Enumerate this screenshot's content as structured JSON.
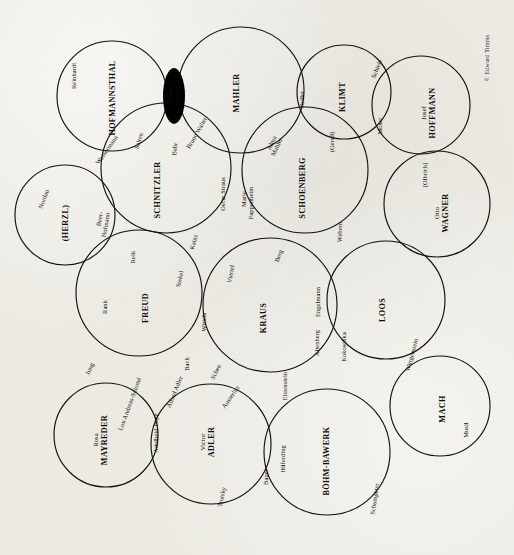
{
  "figure": {
    "credit": "© Edward Timms",
    "orientation": "rotated-90-ccw",
    "line_color": "#14120f",
    "background_color": "#eceae3"
  },
  "chart_data": {
    "type": "diagram",
    "subtype": "venn-circles-network",
    "annotations": [
      "© Edward Timms"
    ],
    "circles": [
      {
        "label": "HOFMANNSTHAL",
        "prefix": "",
        "cx": 112,
        "cy": 96,
        "r": 55
      },
      {
        "label": "MAHLER",
        "prefix": "",
        "cx": 241,
        "cy": 90,
        "r": 63
      },
      {
        "label": "KLIMT",
        "prefix": "",
        "cx": 344,
        "cy": 92,
        "r": 47
      },
      {
        "label": "HOFFMANN",
        "prefix": "Josef",
        "cx": 421,
        "cy": 105,
        "r": 49
      },
      {
        "label": "SCHNITZLER",
        "prefix": "",
        "cx": 166,
        "cy": 168,
        "r": 65
      },
      {
        "label": "SCHOENBERG",
        "prefix": "",
        "cx": 305,
        "cy": 170,
        "r": 63
      },
      {
        "label": "WAGNER",
        "prefix": "Otto",
        "cx": 437,
        "cy": 204,
        "r": 53
      },
      {
        "label": "(HERZL)",
        "prefix": "",
        "cx": 65,
        "cy": 215,
        "r": 50
      },
      {
        "label": "FREUD",
        "prefix": "",
        "cx": 139,
        "cy": 293,
        "r": 63
      },
      {
        "label": "KRAUS",
        "prefix": "",
        "cx": 270,
        "cy": 305,
        "r": 67
      },
      {
        "label": "LOOS",
        "prefix": "",
        "cx": 386,
        "cy": 300,
        "r": 59
      },
      {
        "label": "MAYREDER",
        "prefix": "Rosa",
        "cx": 106,
        "cy": 435,
        "r": 52
      },
      {
        "label": "ADLER",
        "prefix": "Victor",
        "cx": 211,
        "cy": 444,
        "r": 60
      },
      {
        "label": "BÖHM-BAWERK",
        "prefix": "",
        "cx": 327,
        "cy": 452,
        "r": 63
      },
      {
        "label": "MACH",
        "prefix": "",
        "cx": 440,
        "cy": 406,
        "r": 50
      },
      {
        "label": "lens-richard-strauss",
        "prefix": "",
        "cx": 0,
        "cy": 0,
        "r": 0
      }
    ],
    "intersection_labels": [
      {
        "text": "Reinhardt",
        "x": 73,
        "y": 75
      },
      {
        "text": "Wassermann",
        "x": 106,
        "y": 148
      },
      {
        "text": "Salten",
        "x": 137,
        "y": 140
      },
      {
        "text": "Richard\nStrauss",
        "x": 174,
        "y": 94
      },
      {
        "text": "Bahr",
        "x": 174,
        "y": 147
      },
      {
        "text": "Bruno Walter",
        "x": 196,
        "y": 140
      },
      {
        "text": "Oscar Straus",
        "x": 224,
        "y": 193
      },
      {
        "text": "Marie\nPappenheim",
        "x": 247,
        "y": 200
      },
      {
        "text": "Alma\nMahler",
        "x": 275,
        "y": 141
      },
      {
        "text": "Roller",
        "x": 302,
        "y": 98
      },
      {
        "text": "(Gerstl)",
        "x": 332,
        "y": 140
      },
      {
        "text": "Schiele",
        "x": 376,
        "y": 70
      },
      {
        "text": "Moser",
        "x": 379,
        "y": 124
      },
      {
        "text": "[Olbrich]",
        "x": 425,
        "y": 173
      },
      {
        "text": "Nordau",
        "x": 44,
        "y": 197
      },
      {
        "text": "Beer-\nHofmann",
        "x": 104,
        "y": 222
      },
      {
        "text": "Reik",
        "x": 132,
        "y": 255
      },
      {
        "text": "Kainz",
        "x": 194,
        "y": 240
      },
      {
        "text": "Stekel",
        "x": 180,
        "y": 278
      },
      {
        "text": "Viertel",
        "x": 231,
        "y": 272
      },
      {
        "text": "Berg",
        "x": 279,
        "y": 255
      },
      {
        "text": "Webern",
        "x": 339,
        "y": 230
      },
      {
        "text": "Rank",
        "x": 105,
        "y": 305
      },
      {
        "text": "Wittels",
        "x": 203,
        "y": 320
      },
      {
        "text": "Engelmann",
        "x": 318,
        "y": 300
      },
      {
        "text": "Altenberg",
        "x": 317,
        "y": 340
      },
      {
        "text": "Kokoschka",
        "x": 343,
        "y": 344
      },
      {
        "text": "Wittgenstein",
        "x": 411,
        "y": 352
      },
      {
        "text": "Jung",
        "x": 90,
        "y": 367
      },
      {
        "text": "Bach",
        "x": 186,
        "y": 362
      },
      {
        "text": "Scheu",
        "x": 214,
        "y": 370
      },
      {
        "text": "Alfred Adler",
        "x": 172,
        "y": 391
      },
      {
        "text": "Lou Andreas-Salomé",
        "x": 128,
        "y": 400
      },
      {
        "text": "Adelheid Popp",
        "x": 155,
        "y": 431
      },
      {
        "text": "Austerlitz",
        "x": 228,
        "y": 394
      },
      {
        "text": "Ehrenstein",
        "x": 284,
        "y": 383
      },
      {
        "text": "Musil",
        "x": 465,
        "y": 428
      },
      {
        "text": "Trotsky",
        "x": 221,
        "y": 495
      },
      {
        "text": "Bauer",
        "x": 266,
        "y": 475
      },
      {
        "text": "Hilferding",
        "x": 282,
        "y": 457
      },
      {
        "text": "Schumpeter",
        "x": 374,
        "y": 497
      }
    ]
  },
  "labels": {
    "majors": [
      {
        "prefix": "",
        "name": "HOFMANNSTHAL",
        "x": 113,
        "y": 98
      },
      {
        "prefix": "",
        "name": "MAHLER",
        "x": 237,
        "y": 93
      },
      {
        "prefix": "",
        "name": "KLIMT",
        "x": 343,
        "y": 97
      },
      {
        "prefix": "Josef",
        "name": "HOFFMANN",
        "x": 429,
        "y": 113
      },
      {
        "prefix": "",
        "name": "SCHNITZLER",
        "x": 158,
        "y": 190
      },
      {
        "prefix": "",
        "name": "SCHOENBERG",
        "x": 303,
        "y": 188
      },
      {
        "prefix": "Otto",
        "name": "WAGNER",
        "x": 442,
        "y": 213
      },
      {
        "prefix": "",
        "name": "(HERZL)",
        "x": 66,
        "y": 223
      },
      {
        "prefix": "",
        "name": "FREUD",
        "x": 146,
        "y": 308
      },
      {
        "prefix": "",
        "name": "KRAUS",
        "x": 264,
        "y": 318
      },
      {
        "prefix": "",
        "name": "LOOS",
        "x": 383,
        "y": 310
      },
      {
        "prefix": "Rosa",
        "name": "MAYREDER",
        "x": 101,
        "y": 440
      },
      {
        "prefix": "Victor",
        "name": "ADLER",
        "x": 208,
        "y": 442
      },
      {
        "prefix": "",
        "name": "BÖHM-BAWERK",
        "x": 327,
        "y": 461
      },
      {
        "prefix": "",
        "name": "MACH",
        "x": 443,
        "y": 409
      }
    ],
    "minors": [
      {
        "t": "Reinhardt",
        "x": 74,
        "y": 76,
        "rot": -90
      },
      {
        "t": "Wassermann",
        "x": 107,
        "y": 150,
        "rot": -55
      },
      {
        "t": "Salten",
        "x": 139,
        "y": 141,
        "rot": -72
      },
      {
        "t": "Richard",
        "x": 170,
        "y": 94,
        "rot": -90
      },
      {
        "t": "Strauss",
        "x": 177,
        "y": 96,
        "rot": -90
      },
      {
        "t": "Bahr",
        "x": 175,
        "y": 149,
        "rot": -85
      },
      {
        "t": "Bruno Walter",
        "x": 197,
        "y": 133,
        "rot": -60
      },
      {
        "t": "Oscar Straus",
        "x": 223,
        "y": 194,
        "rot": -90
      },
      {
        "t": "Marie",
        "x": 244,
        "y": 199,
        "rot": -90
      },
      {
        "t": "Pappenheim",
        "x": 251,
        "y": 203,
        "rot": -90
      },
      {
        "t": "Alma",
        "x": 272,
        "y": 143,
        "rot": -65
      },
      {
        "t": "Mahler",
        "x": 277,
        "y": 147,
        "rot": -65
      },
      {
        "t": "Roller",
        "x": 302,
        "y": 99,
        "rot": -90
      },
      {
        "t": "(Gerstl)",
        "x": 332,
        "y": 142,
        "rot": -90
      },
      {
        "t": "Schiele",
        "x": 377,
        "y": 69,
        "rot": -68
      },
      {
        "t": "Moser",
        "x": 380,
        "y": 126,
        "rot": -90
      },
      {
        "t": "[Olbrich]",
        "x": 425,
        "y": 175,
        "rot": -90
      },
      {
        "t": "Nordau",
        "x": 44,
        "y": 199,
        "rot": -70
      },
      {
        "t": "Beer-",
        "x": 100,
        "y": 219,
        "rot": -80
      },
      {
        "t": "Hofmann",
        "x": 106,
        "y": 225,
        "rot": -80
      },
      {
        "t": "Reik",
        "x": 133,
        "y": 257,
        "rot": -90
      },
      {
        "t": "Kainz",
        "x": 194,
        "y": 242,
        "rot": -75
      },
      {
        "t": "Stekel",
        "x": 180,
        "y": 279,
        "rot": -78
      },
      {
        "t": "Viertel",
        "x": 231,
        "y": 274,
        "rot": -80
      },
      {
        "t": "Berg",
        "x": 279,
        "y": 256,
        "rot": -70
      },
      {
        "t": "Webern",
        "x": 340,
        "y": 232,
        "rot": -88
      },
      {
        "t": "Rank",
        "x": 105,
        "y": 307,
        "rot": -90
      },
      {
        "t": "Wittels",
        "x": 204,
        "y": 322,
        "rot": -90
      },
      {
        "t": "Engelmann",
        "x": 318,
        "y": 302,
        "rot": -90
      },
      {
        "t": "Altenberg",
        "x": 317,
        "y": 343,
        "rot": -90
      },
      {
        "t": "Kokoschka",
        "x": 344,
        "y": 347,
        "rot": -90
      },
      {
        "t": "Wittgenstein",
        "x": 412,
        "y": 355,
        "rot": -75
      },
      {
        "t": "Jung",
        "x": 90,
        "y": 369,
        "rot": -65
      },
      {
        "t": "Bach",
        "x": 187,
        "y": 364,
        "rot": -90
      },
      {
        "t": "Scheu",
        "x": 216,
        "y": 372,
        "rot": -65
      },
      {
        "t": "Alfred Adler",
        "x": 175,
        "y": 392,
        "rot": -68
      },
      {
        "t": "Lou Andreas-Salomé",
        "x": 130,
        "y": 404,
        "rot": -70
      },
      {
        "t": "Adelheid Popp",
        "x": 156,
        "y": 433,
        "rot": -90
      },
      {
        "t": "Austerlitz",
        "x": 231,
        "y": 397,
        "rot": -55
      },
      {
        "t": "Ehrenstein",
        "x": 285,
        "y": 386,
        "rot": -90
      },
      {
        "t": "Musil",
        "x": 466,
        "y": 430,
        "rot": -90
      },
      {
        "t": "Trotsky",
        "x": 222,
        "y": 497,
        "rot": -78
      },
      {
        "t": "Bauer",
        "x": 266,
        "y": 477,
        "rot": -90
      },
      {
        "t": "Hilferding",
        "x": 283,
        "y": 459,
        "rot": -90
      },
      {
        "t": "Schumpeter",
        "x": 375,
        "y": 499,
        "rot": -82
      }
    ]
  },
  "credit": {
    "text": "© Edward Timms",
    "x": 487,
    "y": 58
  }
}
